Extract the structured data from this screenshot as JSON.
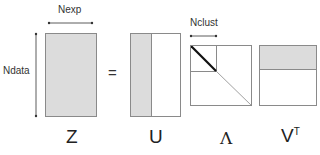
{
  "diagram": {
    "labels": {
      "nexp": "Nexp",
      "ndata": "Ndata",
      "nclust": "Nclust",
      "equals": "="
    },
    "matrices": [
      {
        "id": "Z",
        "label": "Z"
      },
      {
        "id": "U",
        "label": "U"
      },
      {
        "id": "Lambda",
        "label": "Λ"
      },
      {
        "id": "VT",
        "label": "V",
        "superscript": "T"
      }
    ],
    "colors": {
      "shade": "#dcdcdc",
      "border": "#8a8a8a",
      "diagonal_thick": "#111111",
      "diagonal_thin": "#888888"
    }
  }
}
